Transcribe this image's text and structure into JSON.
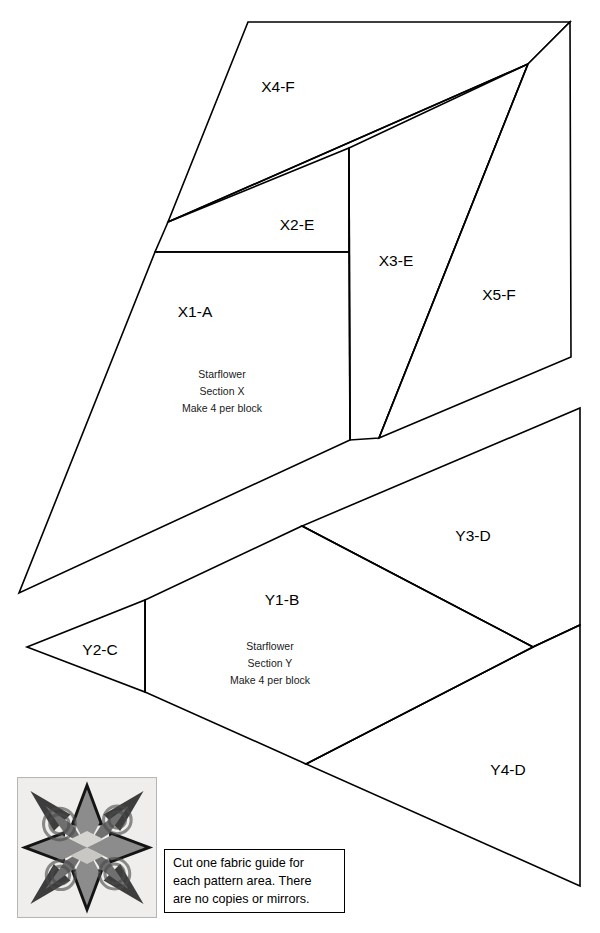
{
  "document": {
    "title": "Starflower Foundation Piecing Pattern"
  },
  "sections": {
    "x": {
      "note_lines": [
        "Starflower",
        "Section X",
        "Make 4 per block"
      ],
      "pieces": [
        {
          "label": "X1-A",
          "x": 195,
          "y": 313
        },
        {
          "label": "X2-E",
          "x": 272,
          "y": 226
        },
        {
          "label": "X3-E",
          "x": 396,
          "y": 262
        },
        {
          "label": "X4-F",
          "x": 278,
          "y": 88
        },
        {
          "label": "X5-F",
          "x": 499,
          "y": 296
        }
      ]
    },
    "y": {
      "note_lines": [
        "Starflower",
        "Section Y",
        "Make 4 per block"
      ],
      "pieces": [
        {
          "label": "Y1-B",
          "x": 282,
          "y": 601
        },
        {
          "label": "Y2-C",
          "x": 100,
          "y": 651
        },
        {
          "label": "Y3-D",
          "x": 473,
          "y": 537
        },
        {
          "label": "Y4-D",
          "x": 508,
          "y": 771
        }
      ]
    }
  },
  "caption": {
    "lines": [
      "Cut one fabric guide for",
      "each pattern area. There",
      "are no copies or mirrors."
    ]
  },
  "swatch": {
    "alt": "starflower-quilt-block-photo",
    "colors": {
      "background": "#efeeec",
      "corner_dark": "#141414",
      "point_dark": "#3d3d3d",
      "point_mid": "#8c8c8c",
      "point_light": "#b5b5b5",
      "center": "#d6d4d0"
    }
  },
  "style": {
    "line_color": "#000000",
    "fill_color": "#ffffff",
    "page_background": "#ffffff"
  }
}
